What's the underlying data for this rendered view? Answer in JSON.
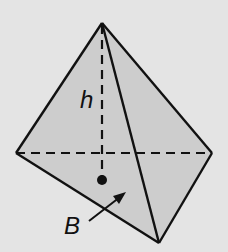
{
  "diagram": {
    "type": "pyramid",
    "colors": {
      "background": "#e4e4e4",
      "face_fill": "#cdcdcd",
      "stroke": "#111111"
    },
    "vertices": {
      "apex": [
        102,
        23
      ],
      "left": [
        16,
        153
      ],
      "right": [
        212,
        153
      ],
      "bottom": [
        159,
        243
      ],
      "base_center": [
        102,
        180
      ]
    },
    "labels": {
      "height": "h",
      "base": "B"
    }
  }
}
